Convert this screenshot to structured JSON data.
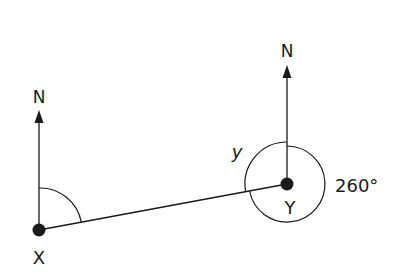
{
  "diagram": {
    "type": "bearings",
    "points": [
      {
        "id": "X",
        "label": "X",
        "x": 39,
        "y": 230
      },
      {
        "id": "Y",
        "label": "Y",
        "x": 287,
        "y": 184
      }
    ],
    "north_label": "N",
    "angle_label_y": "y",
    "angle_label_260": "260°",
    "colors": {
      "stroke": "#1a1a1a",
      "background": "#ffffff"
    }
  }
}
